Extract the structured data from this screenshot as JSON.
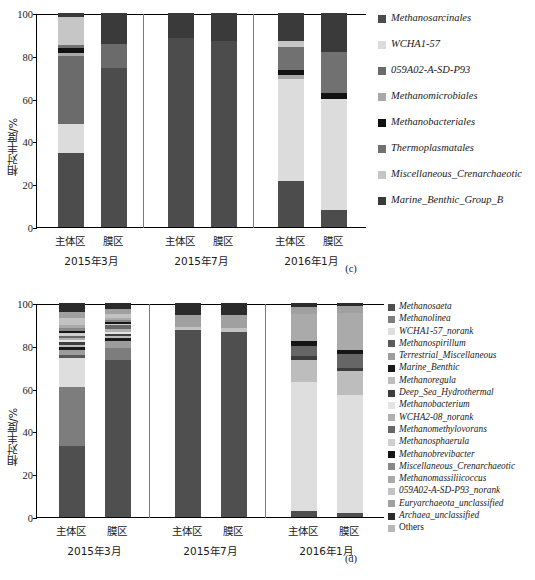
{
  "figure": {
    "panels": [
      {
        "caption": "(c)"
      },
      {
        "caption": "(d)"
      }
    ]
  },
  "chart_data": [
    {
      "type": "bar",
      "subtype": "stacked-100",
      "title": "(c)",
      "xlabel": "",
      "ylabel": "相对丰度/%",
      "ylim": [
        0,
        100
      ],
      "yticks": [
        0,
        20,
        40,
        60,
        80,
        100
      ],
      "grid": false,
      "legend_position": "right",
      "groups": [
        "2015年3月",
        "2015年7月",
        "2016年1月"
      ],
      "categories": [
        "主体区",
        "膜区",
        "主体区",
        "膜区",
        "主体区",
        "膜区"
      ],
      "series": [
        {
          "name": "Methanosarcinales",
          "color": "#4c4c4c",
          "values": [
            34.5,
            74.5,
            88.5,
            87.0,
            21.5,
            8.0
          ]
        },
        {
          "name": "WCHA1-57",
          "color": "#dcdcdc",
          "values": [
            13.5,
            0.0,
            0.0,
            0.0,
            47.5,
            52.0
          ]
        },
        {
          "name": "059A02-A-SD-P93",
          "color": "#6b6b6b",
          "values": [
            32.0,
            11.0,
            0.0,
            0.0,
            0.0,
            0.0
          ]
        },
        {
          "name": "Methanomicrobiales",
          "color": "#a8a8a8",
          "values": [
            1.5,
            0.0,
            0.0,
            0.0,
            2.0,
            0.0
          ]
        },
        {
          "name": "Methanobacteriales",
          "color": "#111111",
          "values": [
            2.0,
            0.0,
            0.0,
            0.0,
            2.5,
            2.5
          ]
        },
        {
          "name": "Thermoplasmatales",
          "color": "#717171",
          "values": [
            1.5,
            0.0,
            0.0,
            0.0,
            10.5,
            19.5
          ]
        },
        {
          "name": "Miscellaneous_Crenarchaeotic",
          "color": "#c6c6c6",
          "values": [
            13.0,
            0.0,
            0.0,
            0.0,
            3.0,
            0.0
          ]
        },
        {
          "name": "Marine_Benthic_Group_B",
          "color": "#3a3a3a",
          "values": [
            2.0,
            14.5,
            11.5,
            13.0,
            13.0,
            18.0
          ]
        }
      ]
    },
    {
      "type": "bar",
      "subtype": "stacked-100",
      "title": "(d)",
      "xlabel": "",
      "ylabel": "相对丰度/%",
      "ylim": [
        0,
        100
      ],
      "yticks": [
        0,
        20,
        40,
        60,
        80,
        100
      ],
      "grid": false,
      "legend_position": "right",
      "groups": [
        "2015年3月",
        "2015年7月",
        "2016年1月"
      ],
      "categories": [
        "主体区",
        "膜区",
        "主体区",
        "膜区",
        "主体区",
        "膜区"
      ],
      "series": [
        {
          "name": "Methanosaeta",
          "color": "#4f4f4f",
          "values": [
            33.0,
            73.5,
            87.5,
            86.5,
            3.0,
            2.0
          ]
        },
        {
          "name": "Methanolinea",
          "color": "#7d7d7d",
          "values": [
            27.5,
            5.5,
            0.0,
            0.0,
            0.0,
            0.0
          ]
        },
        {
          "name": "WCHA1-57_norank",
          "color": "#dedede",
          "values": [
            13.5,
            0.0,
            0.0,
            0.0,
            60.0,
            55.0
          ]
        },
        {
          "name": "Methanospirillum",
          "color": "#5a5a5a",
          "values": [
            1.5,
            0.0,
            0.0,
            0.0,
            0.0,
            0.0
          ]
        },
        {
          "name": "Terrestrial_Miscellaneous",
          "color": "#9c9c9c",
          "values": [
            2.5,
            3.0,
            0.0,
            0.0,
            0.0,
            0.0
          ]
        },
        {
          "name": "Marine_Benthic",
          "color": "#1a1a1a",
          "values": [
            1.5,
            1.5,
            0.0,
            0.0,
            0.0,
            0.0
          ]
        },
        {
          "name": "Methanoregula",
          "color": "#bdbdbd",
          "values": [
            1.0,
            1.0,
            0.0,
            0.0,
            10.5,
            11.0
          ]
        },
        {
          "name": "Deep_Sea_Hydrothermal",
          "color": "#3d3d3d",
          "values": [
            1.0,
            1.0,
            0.0,
            0.0,
            1.5,
            1.5
          ]
        },
        {
          "name": "Methanobacterium",
          "color": "#e4e4e4",
          "values": [
            1.0,
            1.0,
            0.0,
            0.0,
            0.0,
            0.0
          ]
        },
        {
          "name": "WCHA2-08_norank",
          "color": "#b0b0b0",
          "values": [
            1.0,
            1.5,
            0.0,
            0.0,
            0.0,
            0.0
          ]
        },
        {
          "name": "Methanomethylovorans",
          "color": "#666666",
          "values": [
            1.0,
            1.5,
            0.0,
            0.0,
            5.0,
            6.5
          ]
        },
        {
          "name": "Methanosphaerula",
          "color": "#cfcfcf",
          "values": [
            1.5,
            0.5,
            0.0,
            0.0,
            0.0,
            0.0
          ]
        },
        {
          "name": "Methanobrevibacter",
          "color": "#151515",
          "values": [
            1.0,
            1.0,
            0.0,
            0.0,
            2.0,
            2.0
          ]
        },
        {
          "name": "Miscellaneous_Crenarchaeotic",
          "color": "#888888",
          "values": [
            1.5,
            1.0,
            0.0,
            0.0,
            0.0,
            0.0
          ]
        },
        {
          "name": "Methanomassiliicoccus",
          "color": "#aaaaaa",
          "values": [
            1.0,
            1.0,
            0.0,
            0.0,
            13.0,
            17.5
          ]
        },
        {
          "name": "059A02-A-SD-P93_norank",
          "color": "#c2c2c2",
          "values": [
            3.5,
            2.0,
            1.5,
            2.0,
            0.0,
            0.0
          ]
        },
        {
          "name": "Euryarchaeota_unclassified",
          "color": "#a0a0a0",
          "values": [
            3.0,
            2.0,
            5.5,
            6.0,
            3.0,
            3.0
          ]
        },
        {
          "name": "Archaea_unclassified",
          "color": "#2b2b2b",
          "values": [
            4.0,
            3.0,
            5.5,
            5.5,
            2.0,
            1.5
          ]
        },
        {
          "name": "Others",
          "color": "#b8b8b8",
          "values": [
            0.0,
            0.0,
            0.0,
            0.0,
            0.0,
            0.0
          ]
        }
      ]
    }
  ]
}
